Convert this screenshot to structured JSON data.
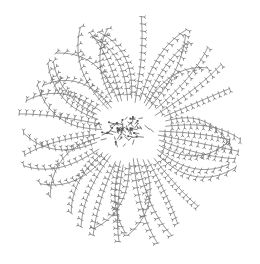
{
  "diagram": {
    "type": "molecular-structure",
    "center": [
      130,
      130
    ],
    "radius_x": 112,
    "radius_y": 118,
    "arm_count": 44,
    "units_per_arm": 12,
    "colors": {
      "background": "#ffffff",
      "bond": "#6e6e6e",
      "unit": "#5a5a5a",
      "core": "#4a4a4a"
    }
  }
}
